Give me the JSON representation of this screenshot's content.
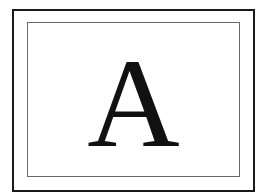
{
  "card": {
    "letter": "A"
  },
  "colors": {
    "outer_border": "#1a1a1a",
    "inner_border": "#6a6a6a",
    "letter": "#111111",
    "background": "#ffffff"
  }
}
